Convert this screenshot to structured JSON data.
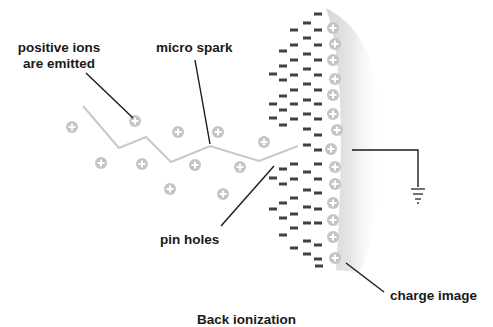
{
  "labels": {
    "positive_ions": [
      "positive ions",
      "are emitted"
    ],
    "micro_spark": "micro spark",
    "pin_holes": "pin holes",
    "charge_image": "charge image",
    "caption": "Back ionization"
  },
  "colors": {
    "ion": "#c4c4c4",
    "ion_glyph": "#ffffff",
    "negative": "#404040",
    "spark": "#c8c8c8",
    "leader": "#1a1a1a",
    "surface_shade": "#d8d8d8",
    "text": "#1a1a1a"
  },
  "emitted_ions": [
    [
      72,
      127
    ],
    [
      135,
      121
    ],
    [
      178,
      132
    ],
    [
      218,
      132
    ],
    [
      264,
      142
    ],
    [
      101,
      163
    ],
    [
      142,
      164
    ],
    [
      195,
      165
    ],
    [
      240,
      167
    ],
    [
      170,
      189
    ],
    [
      223,
      194
    ]
  ],
  "surface_ions": [
    [
      333,
      28
    ],
    [
      335,
      44
    ],
    [
      333,
      60
    ],
    [
      335,
      79
    ],
    [
      333,
      95
    ],
    [
      333,
      114
    ],
    [
      337,
      130
    ],
    [
      331,
      149
    ],
    [
      335,
      167
    ],
    [
      335,
      184
    ],
    [
      333,
      203
    ],
    [
      333,
      220
    ],
    [
      333,
      237
    ],
    [
      335,
      258
    ]
  ],
  "negative_charges": [
    [
      318,
      14
    ],
    [
      307,
      23
    ],
    [
      294,
      30
    ],
    [
      318,
      30
    ],
    [
      307,
      38
    ],
    [
      294,
      45
    ],
    [
      318,
      45
    ],
    [
      283,
      51
    ],
    [
      307,
      54
    ],
    [
      294,
      60
    ],
    [
      318,
      60
    ],
    [
      283,
      66
    ],
    [
      307,
      69
    ],
    [
      273,
      74
    ],
    [
      294,
      75
    ],
    [
      318,
      75
    ],
    [
      283,
      80
    ],
    [
      307,
      84
    ],
    [
      294,
      90
    ],
    [
      318,
      90
    ],
    [
      283,
      96
    ],
    [
      307,
      100
    ],
    [
      273,
      104
    ],
    [
      294,
      104
    ],
    [
      318,
      104
    ],
    [
      283,
      110
    ],
    [
      307,
      114
    ],
    [
      273,
      118
    ],
    [
      294,
      119
    ],
    [
      318,
      119
    ],
    [
      283,
      125
    ],
    [
      307,
      129
    ],
    [
      318,
      135
    ],
    [
      307,
      145
    ],
    [
      318,
      150
    ],
    [
      294,
      164
    ],
    [
      318,
      164
    ],
    [
      283,
      169
    ],
    [
      307,
      172
    ],
    [
      273,
      178
    ],
    [
      294,
      179
    ],
    [
      318,
      179
    ],
    [
      283,
      184
    ],
    [
      307,
      190
    ],
    [
      318,
      193
    ],
    [
      294,
      198
    ],
    [
      283,
      203
    ],
    [
      307,
      207
    ],
    [
      273,
      209
    ],
    [
      318,
      209
    ],
    [
      294,
      214
    ],
    [
      283,
      218
    ],
    [
      307,
      223
    ],
    [
      318,
      223
    ],
    [
      294,
      228
    ],
    [
      283,
      235
    ],
    [
      307,
      241
    ],
    [
      318,
      245
    ],
    [
      294,
      248
    ],
    [
      307,
      254
    ],
    [
      318,
      259
    ],
    [
      319,
      266
    ]
  ],
  "spark_path": "M83,106 L119,148 L146,137 L171,162 L210,146 L259,161 L298,146",
  "ground": {
    "wire": "M352,150 L418,150 L418,187",
    "bars": [
      [
        411,
        425,
        189
      ],
      [
        413,
        423,
        194
      ],
      [
        415,
        421,
        199
      ],
      [
        417,
        419,
        203
      ]
    ]
  }
}
